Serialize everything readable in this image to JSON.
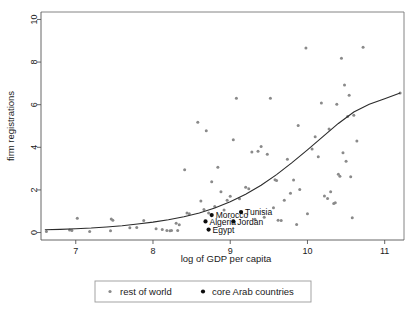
{
  "chart_data": {
    "type": "scatter",
    "title": "",
    "xlabel": "log of GDP per capita",
    "ylabel": "firm registrations",
    "xlim": [
      6.55,
      11.25
    ],
    "ylim": [
      -0.35,
      10.35
    ],
    "xticks": [
      7,
      8,
      9,
      10,
      11
    ],
    "xtick_labels": [
      "7",
      "8",
      "9",
      "10",
      "11"
    ],
    "yticks": [
      0,
      2,
      4,
      6,
      8,
      10
    ],
    "ytick_labels": [
      "0",
      "2",
      "4",
      "6",
      "8",
      "10"
    ],
    "grid": false,
    "legend_position": "bottom-center",
    "series": [
      {
        "name": "rest of world",
        "marker": "small-dot",
        "color": "#8a8a8a",
        "points": [
          [
            6.62,
            0.05
          ],
          [
            6.92,
            0.12
          ],
          [
            6.95,
            0.1
          ],
          [
            7.02,
            0.67
          ],
          [
            7.18,
            0.05
          ],
          [
            7.45,
            0.08
          ],
          [
            7.46,
            0.63
          ],
          [
            7.48,
            0.58
          ],
          [
            7.7,
            0.22
          ],
          [
            7.79,
            0.24
          ],
          [
            7.88,
            0.56
          ],
          [
            8.04,
            0.18
          ],
          [
            8.12,
            0.14
          ],
          [
            8.18,
            0.1
          ],
          [
            8.22,
            0.08
          ],
          [
            8.24,
            0.1
          ],
          [
            8.3,
            0.44
          ],
          [
            8.32,
            0.1
          ],
          [
            8.34,
            0.36
          ],
          [
            8.41,
            2.95
          ],
          [
            8.44,
            0.92
          ],
          [
            8.47,
            0.88
          ],
          [
            8.58,
            5.18
          ],
          [
            8.62,
            1.48
          ],
          [
            8.66,
            1.08
          ],
          [
            8.69,
            4.78
          ],
          [
            8.72,
            0.92
          ],
          [
            8.76,
            2.38
          ],
          [
            8.8,
            1.22
          ],
          [
            8.84,
            3.06
          ],
          [
            8.88,
            1.92
          ],
          [
            8.92,
            1.06
          ],
          [
            8.96,
            1.52
          ],
          [
            9.0,
            1.7
          ],
          [
            9.04,
            4.36
          ],
          [
            9.08,
            6.3
          ],
          [
            9.12,
            1.58
          ],
          [
            9.2,
            2.12
          ],
          [
            9.24,
            2.06
          ],
          [
            9.28,
            3.78
          ],
          [
            9.32,
            0.62
          ],
          [
            9.36,
            3.82
          ],
          [
            9.4,
            4.04
          ],
          [
            9.44,
            0.72
          ],
          [
            9.48,
            3.68
          ],
          [
            9.52,
            6.3
          ],
          [
            9.56,
            1.16
          ],
          [
            9.58,
            2.48
          ],
          [
            9.6,
            2.44
          ],
          [
            9.62,
            0.58
          ],
          [
            9.66,
            0.56
          ],
          [
            9.7,
            1.52
          ],
          [
            9.74,
            3.44
          ],
          [
            9.78,
            1.84
          ],
          [
            9.82,
            2.46
          ],
          [
            9.86,
            0.38
          ],
          [
            9.88,
            5.02
          ],
          [
            9.9,
            2.02
          ],
          [
            9.98,
            8.66
          ],
          [
            10.0,
            0.88
          ],
          [
            10.06,
            3.92
          ],
          [
            10.1,
            4.5
          ],
          [
            10.14,
            3.56
          ],
          [
            10.18,
            6.08
          ],
          [
            10.22,
            1.72
          ],
          [
            10.26,
            1.6
          ],
          [
            10.28,
            4.86
          ],
          [
            10.3,
            1.92
          ],
          [
            10.34,
            1.36
          ],
          [
            10.36,
            1.4
          ],
          [
            10.38,
            6.02
          ],
          [
            10.4,
            2.74
          ],
          [
            10.42,
            2.64
          ],
          [
            10.44,
            8.18
          ],
          [
            10.46,
            3.74
          ],
          [
            10.48,
            6.92
          ],
          [
            10.5,
            3.34
          ],
          [
            10.52,
            5.44
          ],
          [
            10.54,
            6.44
          ],
          [
            10.56,
            2.62
          ],
          [
            10.58,
            0.7
          ],
          [
            10.6,
            5.5
          ],
          [
            10.64,
            4.3
          ],
          [
            10.72,
            8.7
          ],
          [
            11.2,
            6.55
          ]
        ]
      },
      {
        "name": "core Arab countries",
        "marker": "dot",
        "color": "#0d0d0d",
        "points": [
          [
            8.68,
            0.52
          ],
          [
            8.72,
            0.14
          ],
          [
            8.76,
            0.82
          ],
          [
            9.04,
            0.52
          ],
          [
            9.14,
            0.96
          ]
        ],
        "labels": [
          "Algeria",
          "Egypt",
          "Morocco",
          "Jordan",
          "Tunisia"
        ]
      }
    ],
    "fit_curve": {
      "name": "fitted trend",
      "color": "#2b2b2b",
      "points": [
        [
          6.6,
          0.13
        ],
        [
          6.8,
          0.15
        ],
        [
          7.0,
          0.18
        ],
        [
          7.2,
          0.21
        ],
        [
          7.4,
          0.26
        ],
        [
          7.6,
          0.32
        ],
        [
          7.8,
          0.4
        ],
        [
          8.0,
          0.49
        ],
        [
          8.2,
          0.6
        ],
        [
          8.4,
          0.74
        ],
        [
          8.6,
          0.92
        ],
        [
          8.8,
          1.15
        ],
        [
          9.0,
          1.44
        ],
        [
          9.2,
          1.8
        ],
        [
          9.4,
          2.22
        ],
        [
          9.6,
          2.72
        ],
        [
          9.8,
          3.28
        ],
        [
          10.0,
          3.88
        ],
        [
          10.2,
          4.5
        ],
        [
          10.4,
          5.12
        ],
        [
          10.6,
          5.66
        ],
        [
          10.8,
          6.02
        ],
        [
          11.0,
          6.28
        ],
        [
          11.2,
          6.55
        ]
      ]
    },
    "legend": [
      {
        "label": "rest of world",
        "marker_color": "#8a8a8a",
        "marker": "small-dot"
      },
      {
        "label": "core Arab countries",
        "marker_color": "#0d0d0d",
        "marker": "dot"
      }
    ]
  }
}
